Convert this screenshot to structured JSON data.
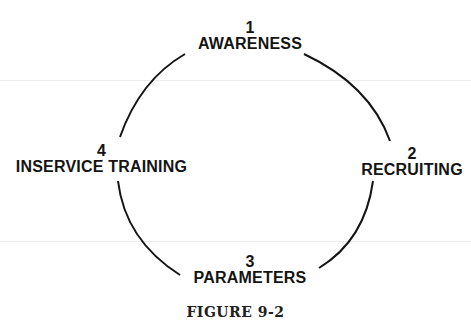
{
  "diagram": {
    "type": "cycle",
    "nodes": [
      {
        "number": "1",
        "label": "AWARENESS"
      },
      {
        "number": "2",
        "label": "RECRUITING"
      },
      {
        "number": "3",
        "label": "PARAMETERS"
      },
      {
        "number": "4",
        "label": "INSERVICE TRAINING"
      }
    ],
    "edges": [
      {
        "from": "1",
        "to": "2"
      },
      {
        "from": "2",
        "to": "3"
      },
      {
        "from": "3",
        "to": "4"
      },
      {
        "from": "4",
        "to": "1"
      }
    ],
    "caption": "FIGURE 9-2",
    "colors": {
      "ink": "#141414",
      "background": "#ffffff"
    }
  }
}
